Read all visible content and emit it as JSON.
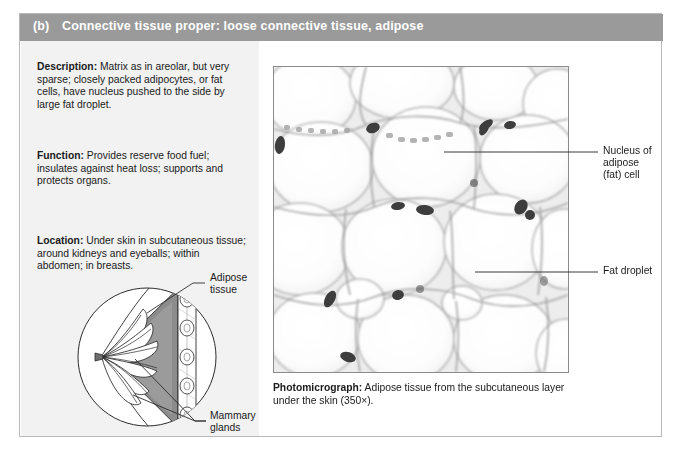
{
  "figure": {
    "header": {
      "panel_letter": "(b)",
      "title": "Connective tissue proper: loose connective tissue, adipose"
    },
    "text_blocks": [
      {
        "heading": "Description:",
        "body": " Matrix as in areolar, but very sparse; closely packed adipocytes, or fat cells, have nucleus pushed to the side by large fat droplet."
      },
      {
        "heading": "Function:",
        "body": " Provides reserve food fuel; insulates against heat loss; supports and protects organs."
      },
      {
        "heading": "Location:",
        "body": " Under skin in subcutaneous tissue; around kidneys and eyeballs; within abdomen; in breasts."
      }
    ],
    "diagram_labels": {
      "adipose_line1": "Adipose",
      "adipose_line2": "tissue",
      "mammary_line1": "Mammary",
      "mammary_line2": "glands"
    },
    "micrograph_labels": {
      "nucleus_line1": "Nucleus of",
      "nucleus_line2": "adipose",
      "nucleus_line3": "(fat) cell",
      "fat_droplet": "Fat droplet"
    },
    "photomicrograph_caption": {
      "heading": "Photomicrograph:",
      "body": " Adipose tissue from the subcutaneous layer under the skin (350×)."
    },
    "colors": {
      "header_bar": "#9a9a9a",
      "header_text": "#ffffff",
      "panel_background": "#f2f2f2",
      "body_text": "#1a1a1a",
      "figure_border": "#b9b9b9",
      "micrograph_border": "#8b8b8b",
      "adipose_fill": "#8c8c8c",
      "gland_fill": "#ffffff",
      "leader_line": "#3a3a3a"
    }
  }
}
